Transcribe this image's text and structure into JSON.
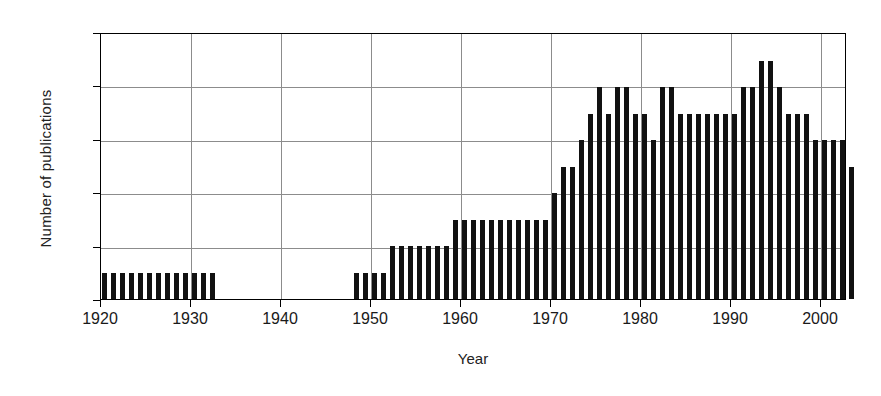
{
  "chart_data": {
    "type": "bar",
    "title": "",
    "xlabel": "Year",
    "ylabel": "Number of publications",
    "xlim": [
      1920,
      2003
    ],
    "ylim": [
      0,
      10
    ],
    "ytick_labels": [
      "0",
      "2",
      "4",
      "6",
      "8",
      "10"
    ],
    "yticks": [
      0,
      2,
      4,
      6,
      8,
      10
    ],
    "xtick_labels": [
      "1920",
      "1930",
      "1940",
      "1950",
      "1960",
      "1970",
      "1980",
      "1990",
      "2000"
    ],
    "xticks": [
      1920,
      1930,
      1940,
      1950,
      1960,
      1970,
      1980,
      1990,
      2000
    ],
    "grid": "both",
    "legend": "none",
    "bar_color": "#111111",
    "categories": [
      1920,
      1921,
      1922,
      1923,
      1924,
      1925,
      1926,
      1927,
      1928,
      1929,
      1930,
      1931,
      1932,
      1933,
      1934,
      1935,
      1936,
      1937,
      1938,
      1939,
      1940,
      1941,
      1942,
      1943,
      1944,
      1945,
      1946,
      1947,
      1948,
      1949,
      1950,
      1951,
      1952,
      1953,
      1954,
      1955,
      1956,
      1957,
      1958,
      1959,
      1960,
      1961,
      1962,
      1963,
      1964,
      1965,
      1966,
      1967,
      1968,
      1969,
      1970,
      1971,
      1972,
      1973,
      1974,
      1975,
      1976,
      1977,
      1978,
      1979,
      1980,
      1981,
      1982,
      1983,
      1984,
      1985,
      1986,
      1987,
      1988,
      1989,
      1990,
      1991,
      1992,
      1993,
      1994,
      1995,
      1996,
      1997,
      1998,
      1999,
      2000,
      2001,
      2002,
      2003
    ],
    "values": [
      1,
      1,
      1,
      1,
      1,
      1,
      1,
      1,
      1,
      1,
      1,
      1,
      1,
      0,
      0,
      0,
      0,
      0,
      0,
      0,
      0,
      0,
      0,
      0,
      0,
      0,
      0,
      0,
      1,
      1,
      1,
      1,
      2,
      2,
      2,
      2,
      2,
      2,
      2,
      3,
      3,
      3,
      3,
      3,
      3,
      3,
      3,
      3,
      3,
      3,
      4,
      5,
      5,
      6,
      7,
      8,
      7,
      8,
      8,
      7,
      7,
      6,
      8,
      8,
      7,
      7,
      7,
      7,
      7,
      7,
      7,
      8,
      8,
      9,
      9,
      8,
      7,
      7,
      7,
      6,
      6,
      6,
      6,
      5
    ]
  }
}
